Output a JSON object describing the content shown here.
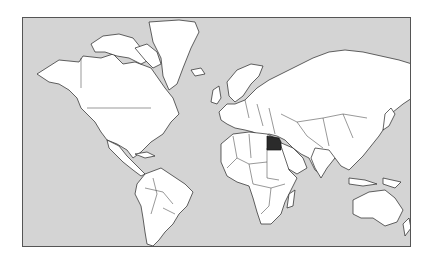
{
  "map": {
    "projection": "Mercator",
    "background_color": "#ffffff",
    "ocean_color": "#d4d4d4",
    "land_color": "#ffffff",
    "border_color": "#222222",
    "highlighted_country": {
      "name": "Egypt",
      "color": "#2b2b2b"
    }
  }
}
